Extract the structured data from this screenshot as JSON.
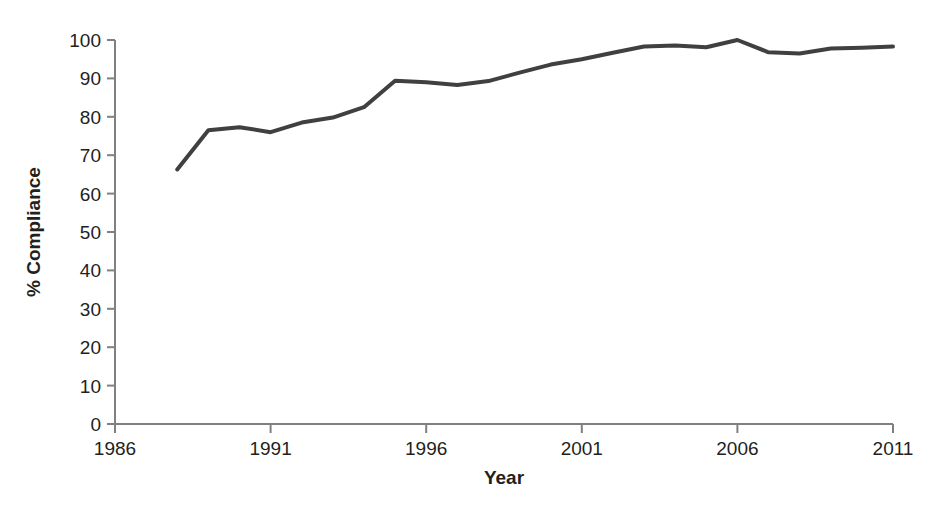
{
  "chart_data": {
    "type": "line",
    "title": "",
    "subtitle": "",
    "xlabel": "Year",
    "ylabel": "% Compliance",
    "xlim": [
      1986,
      2011
    ],
    "ylim": [
      0,
      100
    ],
    "grid": false,
    "legend": null,
    "legend_position": "none",
    "x_ticks": [
      "1986",
      "1991",
      "1996",
      "2001",
      "2006",
      "2011"
    ],
    "x_tick_values": [
      1986,
      1991,
      1996,
      2001,
      2006,
      2011
    ],
    "y_ticks": [
      "0",
      "10",
      "20",
      "30",
      "40",
      "50",
      "60",
      "70",
      "80",
      "90",
      "100"
    ],
    "y_tick_values": [
      0,
      10,
      20,
      30,
      40,
      50,
      60,
      70,
      80,
      90,
      100
    ],
    "series": [
      {
        "name": "% Compliance",
        "color": "#404040",
        "line_width": 4,
        "x": [
          1988,
          1989,
          1990,
          1991,
          1992,
          1993,
          1994,
          1995,
          1996,
          1997,
          1998,
          1999,
          2000,
          2001,
          2002,
          2003,
          2004,
          2005,
          2006,
          2007,
          2008,
          2009,
          2010,
          2011
        ],
        "values": [
          66.3,
          76.5,
          77.3,
          76.0,
          78.5,
          79.8,
          82.5,
          89.4,
          89.0,
          88.3,
          89.3,
          91.5,
          93.6,
          95.0,
          96.7,
          98.3,
          98.6,
          98.1,
          100.0,
          96.8,
          96.5,
          97.8,
          98.0,
          98.3
        ]
      }
    ]
  },
  "axes": {
    "y_axis_title": "% Compliance",
    "x_axis_title": "Year"
  }
}
